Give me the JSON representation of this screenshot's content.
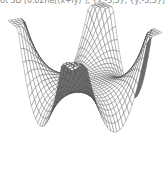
{
  "input_cell": {
    "code": "lot 3D [0.02Re[(x+iy)⁴], {x,-3,3}, {y,-3,3}]"
  },
  "plot": {
    "type": "3d-surface-wireframe",
    "function": "0.02 Re[(x + i y)^4]",
    "x_range": [
      -3,
      3
    ],
    "y_range": [
      -3,
      3
    ],
    "mesh_lines": 30,
    "line_color": "#3a3a3a",
    "fill_color": "#ffffff",
    "shaded_edge_color": "#6e6e6e",
    "background": "#ffffff"
  }
}
